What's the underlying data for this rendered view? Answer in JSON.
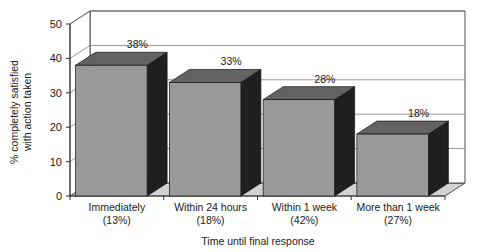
{
  "chart_data": {
    "type": "bar",
    "title": "",
    "subtitle": "",
    "xlabel": "Time until final response",
    "ylabel": "% completely satisfied with action taken",
    "categories": [
      "Immediately",
      "Within 24 hours",
      "Within 1 week",
      "More than 1 week"
    ],
    "category_sublabels": [
      "(13%)",
      "(18%)",
      "(42%)",
      "(27%)"
    ],
    "values": [
      38,
      33,
      28,
      18
    ],
    "value_labels": [
      "38%",
      "33%",
      "28%",
      "18%"
    ],
    "ylim": [
      0,
      50
    ],
    "yticks": [
      0,
      10,
      20,
      30,
      40,
      50
    ],
    "ytick_labels": [
      "0",
      "10",
      "20",
      "30",
      "40",
      "50"
    ],
    "grid": true,
    "legend": "none",
    "style": "3d-column",
    "colors": {
      "bar_front": "#9a9a9a",
      "bar_top": "#636363",
      "bar_side": "#1f1f1f",
      "floor": "#d2d2d2",
      "wall": "#ffffff",
      "axis": "#3a3a3a",
      "grid_line": "#7a7a7a",
      "text": "#1a1a1a"
    }
  }
}
